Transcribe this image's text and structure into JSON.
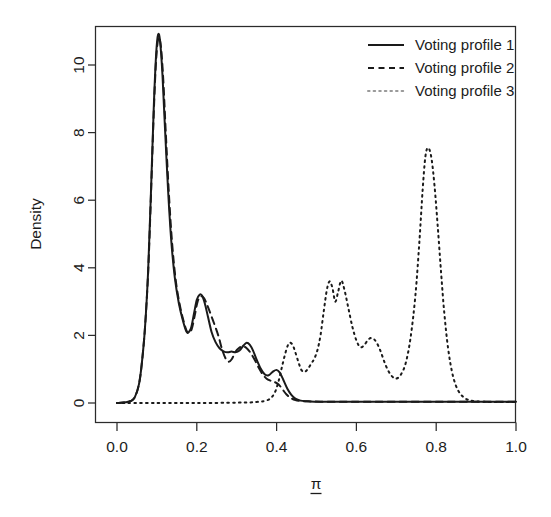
{
  "chart_data": {
    "type": "line",
    "title": "",
    "subtitle": "",
    "xlabel": "π",
    "xlabel_style": "underlined-pi",
    "ylabel": "Density",
    "xlim": [
      0.0,
      1.0
    ],
    "ylim": [
      -0.22,
      11.4
    ],
    "xticks": [
      "0.0",
      "0.2",
      "0.4",
      "0.6",
      "0.8",
      "1.0"
    ],
    "xtick_values": [
      0.0,
      0.2,
      0.4,
      0.6,
      0.8,
      1.0
    ],
    "yticks": [
      "0",
      "2",
      "4",
      "6",
      "8",
      "10"
    ],
    "ytick_values": [
      0,
      2,
      4,
      6,
      8,
      10
    ],
    "grid": false,
    "legend_position": "top-right",
    "legend": [
      "Voting profile 1",
      "Voting profile 2",
      "Voting profile 3"
    ],
    "series": [
      {
        "name": "Voting profile 1",
        "linestyle": "solid",
        "color": "#1a1a1a",
        "x": [
          0.0,
          0.02,
          0.035,
          0.045,
          0.055,
          0.062,
          0.07,
          0.078,
          0.085,
          0.092,
          0.098,
          0.103,
          0.108,
          0.114,
          0.12,
          0.128,
          0.136,
          0.145,
          0.155,
          0.165,
          0.175,
          0.185,
          0.193,
          0.2,
          0.207,
          0.213,
          0.22,
          0.228,
          0.237,
          0.247,
          0.257,
          0.267,
          0.277,
          0.287,
          0.297,
          0.307,
          0.317,
          0.325,
          0.333,
          0.341,
          0.35,
          0.36,
          0.37,
          0.38,
          0.39,
          0.4,
          0.408,
          0.417,
          0.427,
          0.437,
          0.447,
          0.46,
          0.475,
          0.495,
          0.52,
          0.56,
          0.62,
          0.7,
          0.8,
          0.9,
          1.0
        ],
        "y": [
          0.0,
          0.02,
          0.06,
          0.18,
          0.55,
          1.15,
          2.2,
          3.9,
          6.2,
          8.7,
          10.3,
          10.9,
          10.7,
          9.7,
          8.2,
          6.3,
          4.8,
          3.7,
          2.95,
          2.45,
          2.1,
          2.2,
          2.65,
          3.05,
          3.2,
          3.18,
          2.95,
          2.55,
          2.1,
          1.8,
          1.62,
          1.53,
          1.5,
          1.52,
          1.5,
          1.55,
          1.7,
          1.78,
          1.72,
          1.55,
          1.28,
          1.02,
          0.85,
          0.82,
          0.92,
          0.98,
          0.9,
          0.68,
          0.42,
          0.24,
          0.13,
          0.07,
          0.05,
          0.04,
          0.04,
          0.04,
          0.04,
          0.04,
          0.04,
          0.04,
          0.04
        ]
      },
      {
        "name": "Voting profile 2",
        "linestyle": "dashed",
        "color": "#1a1a1a",
        "x": [
          0.0,
          0.02,
          0.035,
          0.045,
          0.055,
          0.062,
          0.07,
          0.078,
          0.085,
          0.092,
          0.098,
          0.104,
          0.11,
          0.116,
          0.122,
          0.13,
          0.138,
          0.147,
          0.157,
          0.167,
          0.177,
          0.187,
          0.195,
          0.202,
          0.21,
          0.218,
          0.226,
          0.235,
          0.245,
          0.255,
          0.263,
          0.272,
          0.28,
          0.288,
          0.296,
          0.305,
          0.315,
          0.325,
          0.335,
          0.345,
          0.355,
          0.365,
          0.375,
          0.385,
          0.395,
          0.405,
          0.415,
          0.425,
          0.435,
          0.447,
          0.46,
          0.48,
          0.51,
          0.56,
          0.62,
          0.7,
          0.8,
          0.9,
          1.0
        ],
        "y": [
          0.0,
          0.02,
          0.06,
          0.18,
          0.55,
          1.15,
          2.2,
          3.85,
          6.1,
          8.55,
          10.15,
          10.8,
          10.55,
          9.55,
          8.05,
          6.2,
          4.75,
          3.65,
          2.92,
          2.42,
          2.08,
          2.18,
          2.6,
          3.0,
          3.15,
          3.1,
          2.9,
          2.62,
          2.3,
          1.95,
          1.6,
          1.32,
          1.22,
          1.3,
          1.5,
          1.62,
          1.68,
          1.62,
          1.48,
          1.28,
          1.05,
          0.85,
          0.72,
          0.66,
          0.62,
          0.55,
          0.4,
          0.25,
          0.15,
          0.09,
          0.06,
          0.05,
          0.04,
          0.04,
          0.04,
          0.04,
          0.04,
          0.04,
          0.04
        ]
      },
      {
        "name": "Voting profile 3",
        "linestyle": "dotted",
        "color": "#8a8a8a",
        "x": [
          0.0,
          0.1,
          0.2,
          0.3,
          0.35,
          0.38,
          0.395,
          0.405,
          0.415,
          0.425,
          0.432,
          0.44,
          0.447,
          0.455,
          0.462,
          0.47,
          0.478,
          0.486,
          0.494,
          0.502,
          0.51,
          0.518,
          0.526,
          0.533,
          0.54,
          0.547,
          0.554,
          0.562,
          0.57,
          0.58,
          0.59,
          0.6,
          0.61,
          0.62,
          0.63,
          0.64,
          0.65,
          0.66,
          0.67,
          0.68,
          0.69,
          0.7,
          0.712,
          0.724,
          0.736,
          0.748,
          0.758,
          0.766,
          0.773,
          0.78,
          0.788,
          0.796,
          0.804,
          0.812,
          0.82,
          0.83,
          0.842,
          0.856,
          0.875,
          0.9,
          0.94,
          1.0
        ],
        "y": [
          0.0,
          0.0,
          0.0,
          0.01,
          0.03,
          0.1,
          0.3,
          0.65,
          1.15,
          1.6,
          1.78,
          1.72,
          1.5,
          1.2,
          0.98,
          0.92,
          1.0,
          1.15,
          1.3,
          1.55,
          2.0,
          2.7,
          3.35,
          3.6,
          3.4,
          3.0,
          3.28,
          3.62,
          3.35,
          2.8,
          2.25,
          1.85,
          1.65,
          1.72,
          1.88,
          1.92,
          1.8,
          1.55,
          1.22,
          0.95,
          0.78,
          0.72,
          0.85,
          1.2,
          1.95,
          3.2,
          4.8,
          6.3,
          7.3,
          7.55,
          7.25,
          6.4,
          5.2,
          3.9,
          2.7,
          1.6,
          0.8,
          0.35,
          0.12,
          0.05,
          0.03,
          0.03
        ]
      }
    ]
  },
  "axes": {
    "y_title": "Density",
    "x_title": "π"
  }
}
